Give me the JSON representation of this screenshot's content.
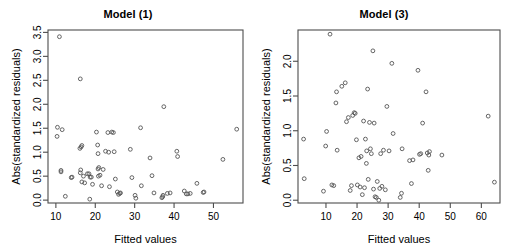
{
  "figure": {
    "background_color": "#ffffff",
    "width": 513,
    "height": 249,
    "panel_count": 2
  },
  "chart_data": [
    {
      "type": "scatter",
      "title": "Model (1)",
      "xlabel": "Fitted values",
      "ylabel": "Abs(standardized residuals)",
      "xlim": [
        8.0,
        57.5
      ],
      "ylim": [
        -0.06,
        3.55
      ],
      "xticks": [
        10,
        20,
        30,
        40,
        50
      ],
      "yticks": [
        0.0,
        0.5,
        1.0,
        1.5,
        2.0,
        2.5,
        3.0,
        3.5
      ],
      "xtick_labels": [
        "10",
        "20",
        "30",
        "40",
        "50"
      ],
      "ytick_labels": [
        "0.0",
        "0.5",
        "1.0",
        "1.5",
        "2.0",
        "2.5",
        "3.0",
        "3.5"
      ],
      "grid": false,
      "legend": "none",
      "marker": "open-circle",
      "marker_color": "#555555",
      "x": [
        10.9,
        10.3,
        10.4,
        11.6,
        11.3,
        11.3,
        12.4,
        13.9,
        14.1,
        16.2,
        16.1,
        16.6,
        16.4,
        16.3,
        16.2,
        16.6,
        17.0,
        17.3,
        18.0,
        18.4,
        18.6,
        18.7,
        19.0,
        19.3,
        20.3,
        20.6,
        20.7,
        20.9,
        20.7,
        20.8,
        21.2,
        21.6,
        22.0,
        22.6,
        23.2,
        23.4,
        23.6,
        24.2,
        24.6,
        24.8,
        25.1,
        25.6,
        25.9,
        26.2,
        26.4,
        28.9,
        29.3,
        30.1,
        30.3,
        31.5,
        31.7,
        33.9,
        34.4,
        34.9,
        36.9,
        37.1,
        37.2,
        37.4,
        38.3,
        39.0,
        40.7,
        40.9,
        42.6,
        43.1,
        43.5,
        44.1,
        45.8,
        47.4,
        47.6,
        52.4,
        55.9
      ],
      "y": [
        3.41,
        1.33,
        1.52,
        1.47,
        0.62,
        0.59,
        0.08,
        0.47,
        0.48,
        2.53,
        1.08,
        1.14,
        1.11,
        0.63,
        0.57,
        0.38,
        0.5,
        0.36,
        0.55,
        0.55,
        0.02,
        0.48,
        0.48,
        0.33,
        1.42,
        1.15,
        0.97,
        0.68,
        0.65,
        0.5,
        0.52,
        0.3,
        0.64,
        1.02,
        1.41,
        1.0,
        0.28,
        1.42,
        1.41,
        1.01,
        0.44,
        0.17,
        0.12,
        0.14,
        0.15,
        1.06,
        0.47,
        0.1,
        0.04,
        1.51,
        0.3,
        0.88,
        0.51,
        0.15,
        0.05,
        0.07,
        0.1,
        1.95,
        0.14,
        0.15,
        1.02,
        0.91,
        0.19,
        0.13,
        0.13,
        0.14,
        0.35,
        0.16,
        0.17,
        0.85,
        1.48
      ]
    },
    {
      "type": "scatter",
      "title": "Model (3)",
      "xlabel": "Fitted values",
      "ylabel": "Abs(standardized residuals)",
      "xlim": [
        1.0,
        66.0
      ],
      "ylim": [
        -0.04,
        2.45
      ],
      "xticks": [
        10,
        20,
        30,
        40,
        50,
        60
      ],
      "yticks": [
        0.0,
        0.5,
        1.0,
        1.5,
        2.0
      ],
      "xtick_labels": [
        "10",
        "20",
        "30",
        "40",
        "50",
        "60"
      ],
      "ytick_labels": [
        "0.0",
        "0.5",
        "1.0",
        "1.5",
        "2.0"
      ],
      "grid": false,
      "legend": "none",
      "marker": "open-circle",
      "marker_color": "#555555",
      "x": [
        2.8,
        3.0,
        9.2,
        9.9,
        10.2,
        11.3,
        11.9,
        12.5,
        13.2,
        13.4,
        13.6,
        15.1,
        16.2,
        16.6,
        17.2,
        17.8,
        18.2,
        18.6,
        19.1,
        19.4,
        19.8,
        20.1,
        20.6,
        21.0,
        21.3,
        21.7,
        22.1,
        22.4,
        22.7,
        23.0,
        23.1,
        23.4,
        23.6,
        24.0,
        24.3,
        24.6,
        25.1,
        25.3,
        25.5,
        25.8,
        26.2,
        26.5,
        27.0,
        27.3,
        27.6,
        28.0,
        28.5,
        29.1,
        29.6,
        30.3,
        31.2,
        31.6,
        33.9,
        34.3,
        34.5,
        36.9,
        37.5,
        38.0,
        39.6,
        40.1,
        40.5,
        41.1,
        42.2,
        42.6,
        42.9,
        43.1,
        43.3,
        47.3,
        62.2,
        64.2
      ],
      "y": [
        0.88,
        0.31,
        0.13,
        0.78,
        0.99,
        2.39,
        0.22,
        0.21,
        1.4,
        1.56,
        0.72,
        1.64,
        1.69,
        1.13,
        1.19,
        0.14,
        0.21,
        1.22,
        1.26,
        1.25,
        0.87,
        0.22,
        0.61,
        0.19,
        0.63,
        0.08,
        1.14,
        0.18,
        0.88,
        0.53,
        0.71,
        1.6,
        0.3,
        1.12,
        0.74,
        0.67,
        2.15,
        0.16,
        1.11,
        0.05,
        0.04,
        0.27,
        0.0,
        0.17,
        0.67,
        0.2,
        0.72,
        0.15,
        1.35,
        0.71,
        1.97,
        0.96,
        0.04,
        0.1,
        0.74,
        0.57,
        0.24,
        0.58,
        1.87,
        0.66,
        0.67,
        1.11,
        1.56,
        0.68,
        0.43,
        0.65,
        0.7,
        0.65,
        1.21,
        0.26
      ]
    }
  ]
}
